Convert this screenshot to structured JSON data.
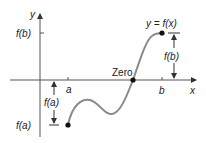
{
  "labels": {
    "y_axis": "y",
    "x_axis": "x",
    "a": "a",
    "b": "b",
    "fb_tick": "f(b)",
    "fa_tick": "f(a)",
    "curve": "y = f(x)",
    "zero": "Zero",
    "fa_dim": "f(a)",
    "fb_dim": "f(b)"
  },
  "colors": {
    "axis": "#555555",
    "curve": "#8a8a8a",
    "point": "#111111",
    "text": "#222222"
  }
}
